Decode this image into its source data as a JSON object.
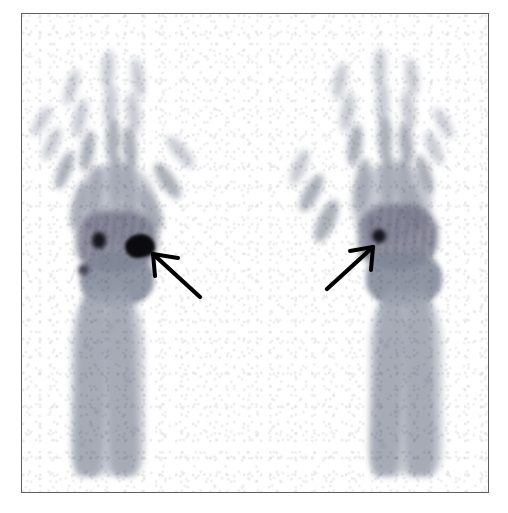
{
  "figure": {
    "modality": "bone-scintigraphy",
    "view": "dorsal-palmar-whole-body-spot-view",
    "body_region": "both hands, wrists and forearms",
    "background_color": "#ffffff",
    "frame_color": "#5b5f63",
    "bone_tone": "#969ca8",
    "hotspot_color": "#0a0a0f",
    "arrow_color": "#000000",
    "caption": "",
    "labels": []
  },
  "frame": {
    "x": 21,
    "y": 13,
    "width": 468,
    "height": 480,
    "border_width": 1
  },
  "panels": [
    {
      "id": "left-extremity",
      "name": "Left hand and forearm",
      "side_on_image": "left",
      "findings": [
        {
          "name": "intense-focal-uptake",
          "location": "distal-radius-scaphoid-region",
          "intensity": "intense",
          "marked_by_arrow": true
        },
        {
          "name": "moderate-focal-uptake",
          "location": "carpal-row",
          "intensity": "moderate",
          "marked_by_arrow": false
        },
        {
          "name": "faint-focal-uptake",
          "location": "ulnar-carpal-region",
          "intensity": "faint",
          "marked_by_arrow": false
        }
      ]
    },
    {
      "id": "right-extremity",
      "name": "Right hand and forearm",
      "side_on_image": "right",
      "findings": [
        {
          "name": "small-focal-uptake",
          "location": "radial-carpal-region",
          "intensity": "moderate",
          "marked_by_arrow": true
        }
      ]
    }
  ],
  "arrows": [
    {
      "id": "arrow-left",
      "points_to": "left-wrist-intense-focus",
      "direction": "up-left",
      "tail_x": 196,
      "tail_y": 293,
      "head_x": 153,
      "head_y": 252
    },
    {
      "id": "arrow-right",
      "points_to": "right-wrist-focal-uptake",
      "direction": "up-right",
      "tail_x": 327,
      "tail_y": 284,
      "head_x": 369,
      "head_y": 246
    }
  ],
  "anatomy": {
    "left_hand": {
      "digits": [
        "thumb",
        "index",
        "middle",
        "ring",
        "little"
      ],
      "segments": [
        "distal phalanx",
        "middle phalanx",
        "proximal phalanx",
        "metacarpal"
      ],
      "wrist": [
        "carpal row",
        "distal radius",
        "distal ulna"
      ],
      "forearm": [
        "radius shaft",
        "ulna shaft"
      ]
    },
    "right_hand": {
      "digits": [
        "thumb",
        "index",
        "middle",
        "ring",
        "little"
      ],
      "segments": [
        "distal phalanx",
        "middle phalanx",
        "proximal phalanx",
        "metacarpal"
      ],
      "wrist": [
        "carpal row",
        "distal radius",
        "distal ulna"
      ],
      "forearm": [
        "radius shaft",
        "ulna shaft"
      ]
    }
  }
}
